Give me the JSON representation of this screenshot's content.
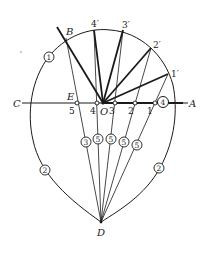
{
  "diagram": {
    "type": "geometric-construction",
    "points": {
      "A": {
        "label": "A",
        "x": 188,
        "y": 103
      },
      "B": {
        "label": "B",
        "x": 66,
        "y": 38
      },
      "C": {
        "label": "C",
        "x": 22,
        "y": 103
      },
      "D": {
        "label": "D",
        "x": 101,
        "y": 222
      },
      "E": {
        "label": "E",
        "x": 77,
        "y": 103
      },
      "O": {
        "label": "O",
        "x": 103,
        "y": 103
      }
    },
    "axis_marks": [
      {
        "label": "5",
        "x": 77
      },
      {
        "label": "4",
        "x": 97
      },
      {
        "label": "3",
        "x": 115
      },
      {
        "label": "2",
        "x": 135
      },
      {
        "label": "1",
        "x": 155
      }
    ],
    "arc_points": [
      {
        "label": "4′",
        "x": 94,
        "y": 30
      },
      {
        "label": "3′",
        "x": 123,
        "y": 30
      },
      {
        "label": "2′",
        "x": 151,
        "y": 48
      },
      {
        "label": "1′",
        "x": 168,
        "y": 74
      }
    ],
    "circled_labels": [
      {
        "label": "1",
        "x": 49,
        "y": 57
      },
      {
        "label": "4",
        "x": 163,
        "y": 102
      },
      {
        "label": "2",
        "x": 45,
        "y": 170
      },
      {
        "label": "2",
        "x": 159,
        "y": 168
      },
      {
        "label": "3",
        "x": 86,
        "y": 142
      },
      {
        "label": "5",
        "x": 98,
        "y": 139
      },
      {
        "label": "5",
        "x": 111,
        "y": 139
      },
      {
        "label": "5",
        "x": 124,
        "y": 142
      },
      {
        "label": "5",
        "x": 137,
        "y": 145
      }
    ],
    "stroke_color": "#1a1a1a",
    "background": "#ffffff"
  }
}
